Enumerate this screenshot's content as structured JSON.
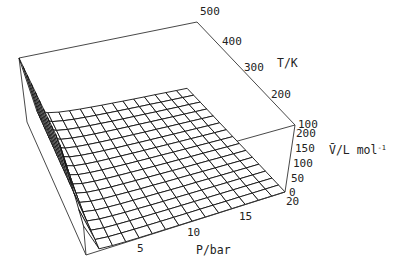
{
  "chart_data": {
    "type": "surface3d",
    "title": "",
    "x_axis": {
      "label": "P/bar",
      "ticks": [
        5,
        10,
        15,
        20
      ],
      "range": [
        0.1,
        20
      ]
    },
    "y_axis": {
      "label": "T/K",
      "ticks": [
        100,
        200,
        300,
        400,
        500
      ],
      "range": [
        100,
        500
      ]
    },
    "z_axis": {
      "label": "V̄/L mol",
      "label_superscript": "-1",
      "ticks": [
        0,
        50,
        100,
        150,
        200
      ],
      "range": [
        0,
        200
      ]
    },
    "function": "V = min(R*T/P, 200), R = 0.08314 L bar K^-1 mol^-1",
    "grid": {
      "p_lines": 16,
      "t_lines": 16
    },
    "box": true,
    "mesh_color": "#111111",
    "face_color": "#ffffff"
  },
  "labels": {
    "t_title": "T/K",
    "v_title": "V̄/L mol",
    "v_sup": "-1",
    "p_title": "P/bar"
  }
}
